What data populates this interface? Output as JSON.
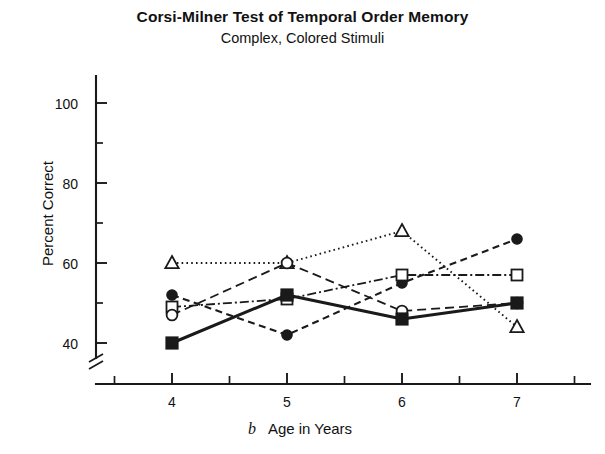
{
  "chart_data": {
    "type": "line",
    "title": "Corsi-Milner Test of Temporal Order Memory",
    "subtitle": "Complex, Colored Stimuli",
    "panel_label": "b",
    "xlabel": "Age in Years",
    "ylabel": "Percent Correct",
    "x": [
      4,
      5,
      6,
      7
    ],
    "xticklabels": [
      "4",
      "5",
      "6",
      "7"
    ],
    "yticklabels": [
      "40",
      "60",
      "80",
      "100"
    ],
    "ytickvalues": [
      40,
      60,
      80,
      100
    ],
    "xlim": [
      3.5,
      7.5
    ],
    "ylim": [
      36,
      107
    ],
    "grid": false,
    "legend": "none",
    "axis_break": "y-axis break below 40",
    "minor_ticks": true,
    "series": [
      {
        "name": "series-triangle",
        "marker": "open-triangle",
        "linestyle": "dotted",
        "color": "#1a1a1a",
        "values": [
          60,
          60,
          68,
          44
        ]
      },
      {
        "name": "series-filled-circle",
        "marker": "filled-circle",
        "linestyle": "dashed",
        "color": "#1a1a1a",
        "values": [
          52,
          42,
          55,
          66
        ]
      },
      {
        "name": "series-open-square",
        "marker": "open-square",
        "linestyle": "dash-dot",
        "color": "#1a1a1a",
        "values": [
          49,
          51,
          57,
          57
        ]
      },
      {
        "name": "series-open-circle",
        "marker": "open-circle",
        "linestyle": "dashed-long",
        "color": "#1a1a1a",
        "values": [
          47,
          60,
          48,
          50
        ]
      },
      {
        "name": "series-filled-square",
        "marker": "filled-square",
        "linestyle": "solid",
        "color": "#1a1a1a",
        "values": [
          40,
          52,
          46,
          50
        ]
      }
    ]
  },
  "figure": {
    "title": "Corsi-Milner Test of Temporal Order Memory",
    "subtitle": "Complex, Colored Stimuli",
    "ylabel": "Percent Correct",
    "xlabel": "Age in Years",
    "panel_label": "b",
    "yticks": [
      "100",
      "80",
      "60",
      "40"
    ],
    "xticks": [
      "4",
      "5",
      "6",
      "7"
    ]
  }
}
